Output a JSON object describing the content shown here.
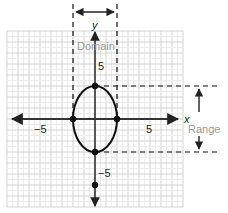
{
  "diagram": {
    "colors": {
      "grid": "#dcdcdc",
      "axis": "#333333",
      "curve": "#111111",
      "dashed": "#111111",
      "annotation_text": "#9a9a9a"
    },
    "axes": {
      "x_label": "x",
      "y_label": "y",
      "x_ticks": [
        {
          "value": -5,
          "label": "−5"
        },
        {
          "value": 5,
          "label": "5"
        }
      ],
      "y_ticks": [
        {
          "value": 5,
          "label": "5"
        },
        {
          "value": -5,
          "label": "−5"
        }
      ],
      "grid_range": {
        "x": [
          -8,
          8
        ],
        "y": [
          -8,
          8
        ]
      }
    },
    "ellipse": {
      "center": [
        0,
        0
      ],
      "semi_x": 2,
      "semi_y": 3
    },
    "points": [
      {
        "x": -2,
        "y": 0
      },
      {
        "x": 2,
        "y": 0
      },
      {
        "x": 0,
        "y": 3
      },
      {
        "x": 0,
        "y": -3
      },
      {
        "x": 0,
        "y": -6
      }
    ],
    "annotations": {
      "domain_label": "Domain",
      "range_label": "Range",
      "domain": [
        -2,
        2
      ],
      "range": [
        -3,
        3
      ]
    }
  }
}
